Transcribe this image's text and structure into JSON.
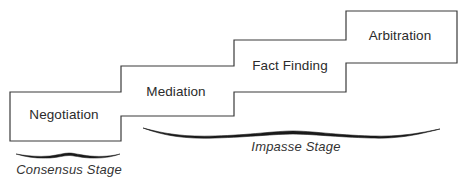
{
  "diagram": {
    "type": "staircase",
    "steps": [
      {
        "label": "Negotiation",
        "order": 1
      },
      {
        "label": "Mediation",
        "order": 2
      },
      {
        "label": "Fact Finding",
        "order": 3
      },
      {
        "label": "Arbitration",
        "order": 4
      }
    ],
    "stages": [
      {
        "label": "Consensus Stage",
        "covers": [
          "Negotiation"
        ]
      },
      {
        "label": "Impasse Stage",
        "covers": [
          "Mediation",
          "Fact Finding",
          "Arbitration"
        ]
      }
    ],
    "colors": {
      "line": "#3a3a3a",
      "text": "#2b2b2b",
      "background": "#ffffff"
    }
  }
}
